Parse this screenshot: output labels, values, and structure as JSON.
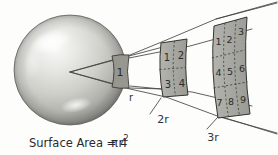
{
  "figure": {
    "caption": {
      "prefix": "Surface Area = 4",
      "pi": "π",
      "variable": "r",
      "exponent": "2",
      "full": "Surface Area = 4πr²"
    },
    "distance_labels": [
      {
        "id": "r",
        "text": "r",
        "x": 131,
        "y": 101
      },
      {
        "id": "2r",
        "text": "2r",
        "x": 162,
        "y": 122
      },
      {
        "id": "3r",
        "text": "3r",
        "x": 212,
        "y": 140
      }
    ],
    "patches": [
      {
        "id": "patch-r",
        "distance": "r",
        "rows": 1,
        "cols": 1,
        "cell_count": 1,
        "cells": [
          "1"
        ]
      },
      {
        "id": "patch-2r",
        "distance": "2r",
        "rows": 2,
        "cols": 2,
        "cell_count": 4,
        "cells": [
          "1",
          "2",
          "3",
          "4"
        ]
      },
      {
        "id": "patch-3r",
        "distance": "3r",
        "rows": 3,
        "cols": 3,
        "cell_count": 9,
        "cells": [
          "1",
          "2",
          "3",
          "4",
          "5",
          "6",
          "7",
          "8",
          "9"
        ]
      }
    ],
    "colors": {
      "background": "#fdfdfc",
      "sphere_light": "#f2f2f0",
      "sphere_mid": "#cfcfcb",
      "sphere_dark": "#9a9a96",
      "sphere_outline": "#6f6f6b",
      "patch_fill": "#a9a9a4",
      "patch_stroke": "#3a3a38",
      "ray_stroke": "#4a4a48",
      "text": "#2a2a2a"
    }
  }
}
